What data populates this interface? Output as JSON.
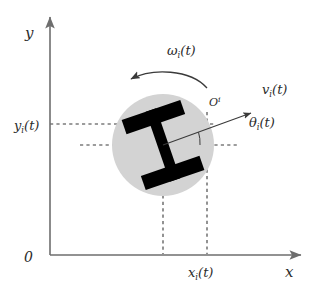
{
  "figure": {
    "type": "kinematics-diagram",
    "width": 314,
    "height": 288,
    "background": "#ffffff"
  },
  "colors": {
    "axis": "#6e6e6e",
    "dashed": "#3a3a3a",
    "body_fill": "#d3d3d3",
    "wheel_fill": "#000000",
    "vector": "#3a3a3a",
    "text": "#2b2b2b"
  },
  "axes": {
    "x_label": "x",
    "y_label": "y",
    "origin_label": "0",
    "x_axis": {
      "x1": 50,
      "y1": 255,
      "x2": 305,
      "y2": 255
    },
    "y_axis": {
      "x1": 50,
      "y1": 255,
      "x2": 50,
      "y2": 13
    }
  },
  "labels": {
    "y_position": {
      "base": "y",
      "sub": "i",
      "paren": "(t)",
      "x": 14,
      "y": 130
    },
    "x_position": {
      "base": "x",
      "sub": "i",
      "paren": "(t)",
      "x": 188,
      "y": 277
    },
    "angular_velocity": {
      "base": "ω",
      "sub": "i",
      "paren": "(t)",
      "x": 167,
      "y": 55
    },
    "linear_velocity": {
      "base": "v",
      "sub": "i",
      "paren": "(t)",
      "x": 262,
      "y": 94
    },
    "heading_angle": {
      "base": "θ",
      "sub": "i",
      "paren": "(t)",
      "x": 249,
      "y": 127
    },
    "body_frame": {
      "base": "O",
      "sup": "i",
      "x": 209,
      "y": 106
    }
  },
  "robot": {
    "center": {
      "x": 163,
      "y": 145
    },
    "body_radius": 51,
    "heading_deg": -19,
    "wheels": [
      {
        "name": "left-wheel",
        "length": 62,
        "thickness": 15
      },
      {
        "name": "right-wheel",
        "length": 62,
        "thickness": 15
      }
    ],
    "axle": {
      "length": 74,
      "thickness": 11
    }
  },
  "vectors": {
    "velocity_arrow": {
      "from": {
        "x": 163,
        "y": 145
      },
      "to": {
        "x": 253,
        "y": 112
      }
    },
    "rotation_arrow": {
      "direction": "counter-clockwise",
      "arrowhead": "left"
    }
  },
  "guides": {
    "horizontal_upper": {
      "x1": 50,
      "y1": 124,
      "x2": 215,
      "y2": 124
    },
    "horizontal_lower": {
      "x1": 80,
      "y1": 145,
      "x2": 237,
      "y2": 145
    },
    "vertical_left": {
      "x1": 163,
      "y1": 125,
      "x2": 163,
      "y2": 255
    },
    "vertical_right": {
      "x1": 207,
      "y1": 112,
      "x2": 207,
      "y2": 255
    }
  }
}
